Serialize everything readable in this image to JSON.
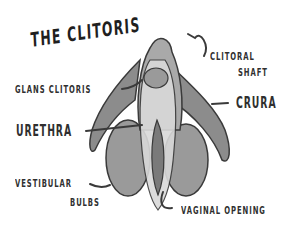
{
  "title": "THE CLITORIS",
  "labels": {
    "glans": "GLANS CLITORIS",
    "shaft_line1": "CLITORAL",
    "shaft_line2": "SHAFT",
    "crura": "CRURA",
    "urethra": "URETHRA",
    "bulbs_line1": "VESTIBULAR",
    "bulbs_line2": "BULBS",
    "vaginal": "VAGINAL OPENING"
  },
  "colors": {
    "outline": "#3a3a3a",
    "dark_fill": "#8c8c8c",
    "mid_fill": "#a9a9a9",
    "light_fill": "#d9d9d9",
    "text": "#2f2f2f"
  }
}
